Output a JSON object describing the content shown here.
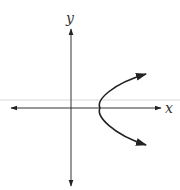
{
  "figure": {
    "x_axis_label": "x",
    "y_axis_label": "y",
    "curve": "parabola opening right, vertex on positive x-axis, arrows on both ends",
    "colors": {
      "axes": "#333333",
      "curve": "#222222",
      "background": "#ffffff",
      "faint_line": "#e6e6e6"
    }
  }
}
